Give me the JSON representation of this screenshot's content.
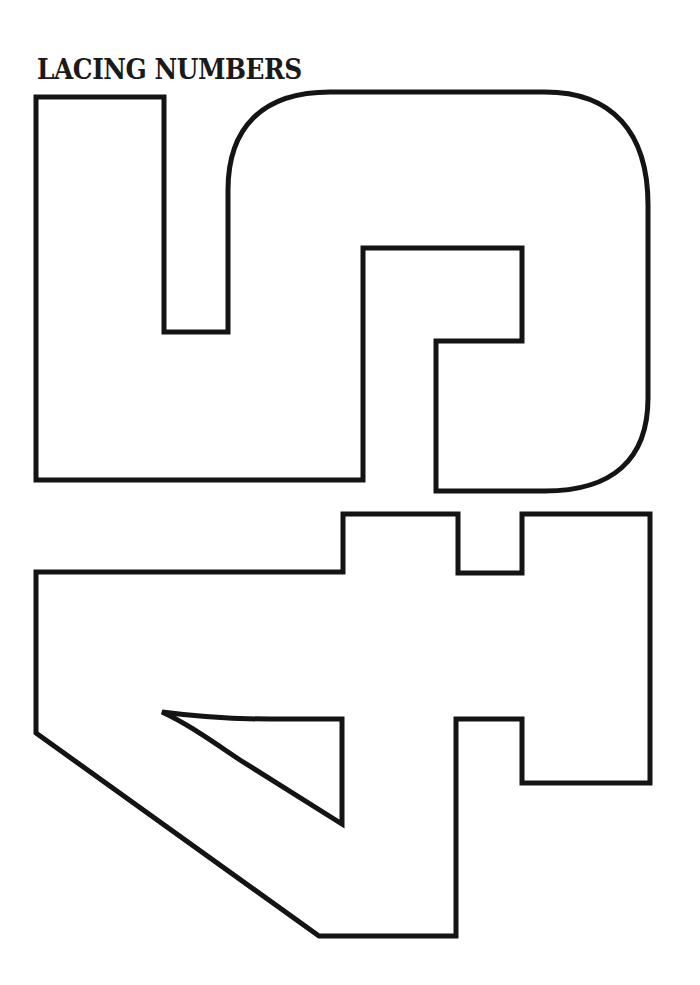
{
  "page": {
    "title": "LACING NUMBERS"
  },
  "shapes": [
    {
      "name": "number-5-outline",
      "digit": "5",
      "orientation": "rotated 90 degrees"
    },
    {
      "name": "number-4-outline",
      "digit": "4",
      "orientation": "rotated 90 degrees"
    }
  ],
  "colors": {
    "background": "#ffffff",
    "outline": "#141414",
    "title": "#1a1a1a"
  }
}
